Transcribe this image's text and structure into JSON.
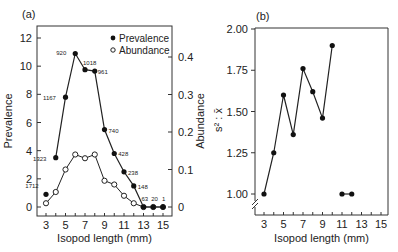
{
  "figure": {
    "panel_a_label": "(a)",
    "panel_b_label": "(b)"
  },
  "chart_data": [
    {
      "panel": "(a)",
      "type": "line",
      "title": "",
      "xlabel": "Isopod length (mm)",
      "ylabel": "Prevalence",
      "y2label": "Abundance",
      "x": [
        3,
        4,
        5,
        6,
        7,
        8,
        9,
        10,
        11,
        12,
        13,
        14,
        15
      ],
      "xticks": [
        3,
        5,
        7,
        9,
        11,
        13,
        15
      ],
      "yticks": [
        0,
        2,
        4,
        6,
        8,
        10,
        12
      ],
      "y2ticks": [
        0,
        0.1,
        0.2,
        0.3,
        0.4
      ],
      "ylim": [
        0,
        12.5
      ],
      "y2lim": [
        0,
        0.416
      ],
      "legend": {
        "position": "upper right",
        "entries": [
          "Prevalence",
          "Abundance"
        ]
      },
      "series": [
        {
          "name": "Prevalence",
          "marker": "filled-circle",
          "axis": "left",
          "values": [
            0.9,
            3.5,
            7.8,
            10.9,
            9.75,
            9.65,
            5.5,
            3.8,
            2.5,
            1.5,
            0,
            0,
            0
          ],
          "point_labels": [
            "1712",
            "1323",
            "1167",
            "920",
            "1018",
            "961",
            "740",
            "428",
            "238",
            "148",
            "63",
            "20",
            "1"
          ]
        },
        {
          "name": "Abundance",
          "marker": "open-circle",
          "axis": "right",
          "values": [
            0.01,
            0.04,
            0.1,
            0.14,
            0.13,
            0.14,
            0.07,
            0.06,
            0.03,
            0.01,
            0,
            0,
            0
          ]
        }
      ]
    },
    {
      "panel": "(b)",
      "type": "line",
      "title": "",
      "xlabel": "Isopod length (mm)",
      "ylabel": "s² : x̄",
      "x": [
        3,
        4,
        5,
        6,
        7,
        8,
        9,
        10,
        11,
        12
      ],
      "xticks": [
        3,
        5,
        7,
        9,
        11,
        13,
        15
      ],
      "yticks": [
        1.0,
        1.25,
        1.5,
        1.75,
        2.0
      ],
      "ytick_labels": [
        "1.00",
        "1.25",
        "1.50",
        "1.75",
        "2.00"
      ],
      "ylim": [
        0.88,
        2.0
      ],
      "axis_break": true,
      "series": [
        {
          "name": "variance-to-mean ratio",
          "marker": "filled-circle",
          "values": [
            1.0,
            1.25,
            1.6,
            1.36,
            1.76,
            1.62,
            1.46,
            1.9,
            1.0,
            1.0
          ],
          "segments": [
            [
              0,
              7
            ],
            [
              8,
              9
            ]
          ]
        }
      ]
    }
  ]
}
